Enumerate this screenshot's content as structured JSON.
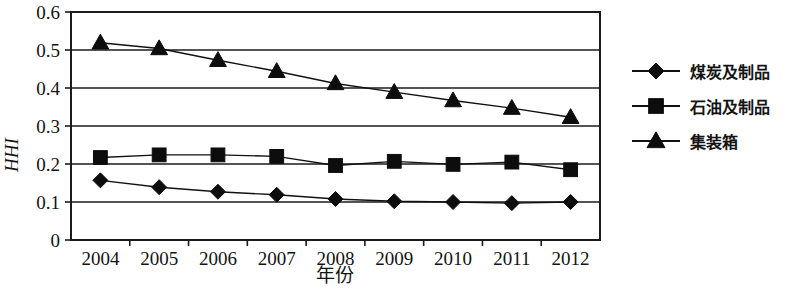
{
  "chart_data": {
    "type": "line",
    "title": "",
    "xlabel": "年份",
    "ylabel": "HHI",
    "categories": [
      "2004",
      "2005",
      "2006",
      "2007",
      "2008",
      "2009",
      "2010",
      "2011",
      "2012"
    ],
    "ylim": [
      0,
      0.6
    ],
    "yticks": [
      "0",
      "0.1",
      "0.2",
      "0.3",
      "0.4",
      "0.5",
      "0.6"
    ],
    "ytick_values": [
      0,
      0.1,
      0.2,
      0.3,
      0.4,
      0.5,
      0.6
    ],
    "grid": "horizontal",
    "legend_position": "right",
    "series": [
      {
        "name": "煤炭及制品",
        "marker": "diamond",
        "values": [
          0.157,
          0.139,
          0.127,
          0.119,
          0.108,
          0.102,
          0.1,
          0.097,
          0.1
        ]
      },
      {
        "name": "石油及制品",
        "marker": "square",
        "values": [
          0.217,
          0.224,
          0.224,
          0.22,
          0.196,
          0.207,
          0.199,
          0.205,
          0.185
        ]
      },
      {
        "name": "集装箱",
        "marker": "triangle",
        "values": [
          0.519,
          0.504,
          0.473,
          0.444,
          0.412,
          0.389,
          0.367,
          0.347,
          0.323
        ]
      }
    ]
  },
  "legend": {
    "items": [
      {
        "label": "煤炭及制品",
        "marker": "diamond"
      },
      {
        "label": "石油及制品",
        "marker": "square"
      },
      {
        "label": "集装箱",
        "marker": "triangle"
      }
    ]
  },
  "axes": {
    "x_title": "年份",
    "y_title": "HHI",
    "x_tick_labels": [
      "2004",
      "2005",
      "2006",
      "2007",
      "2008",
      "2009",
      "2010",
      "2011",
      "2012"
    ],
    "y_tick_labels": [
      "0.6",
      "0.5",
      "0.4",
      "0.3",
      "0.2",
      "0.1",
      "0"
    ]
  },
  "colors": {
    "ink": "#111111",
    "background": "#ffffff"
  }
}
